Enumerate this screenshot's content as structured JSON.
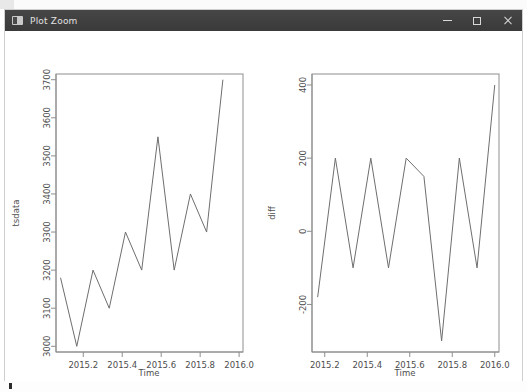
{
  "window": {
    "title": "Plot Zoom",
    "icon": "window-app-icon",
    "controls": {
      "minimize": "minimize-icon",
      "maximize": "maximize-icon",
      "close": "close-icon"
    }
  },
  "colors": {
    "titlebar_bg": "#3f3f3f",
    "titlebar_text": "#e2e2e2",
    "canvas_bg": "#ffffff",
    "axis": "#8e8e8e",
    "series_line": "#6e6e6e",
    "tick_text": "#4d4d4d",
    "desktop": "#fbfbfb"
  },
  "chart_data": [
    {
      "type": "line",
      "id": "tsdata-plot",
      "title": "",
      "xlabel": "Time",
      "ylabel": "tsdata",
      "x": [
        2015.0833,
        2015.1667,
        2015.25,
        2015.3333,
        2015.4167,
        2015.5,
        2015.5833,
        2015.6667,
        2015.75,
        2015.8333,
        2015.9167,
        2016.0
      ],
      "values": [
        3180,
        3000,
        3200,
        3100,
        3300,
        3200,
        3550,
        3200,
        3400,
        3300,
        3700
      ],
      "xtick_labels": [
        "2015.2",
        "2015.4",
        "2015.6",
        "2015.8",
        "2016.0"
      ],
      "xtick_values": [
        2015.2,
        2015.4,
        2015.6,
        2015.8,
        2016.0
      ],
      "ytick_labels": [
        "3000",
        "3100",
        "3200",
        "3300",
        "3400",
        "3500",
        "3600",
        "3700"
      ],
      "ytick_values": [
        3000,
        3100,
        3200,
        3300,
        3400,
        3500,
        3600,
        3700
      ],
      "xlim": [
        2015.06,
        2016.02
      ],
      "ylim": [
        2985,
        3715
      ],
      "grid": false,
      "legend": false
    },
    {
      "type": "line",
      "id": "diff-plot",
      "title": "",
      "xlabel": "Time",
      "ylabel": "diff",
      "x": [
        2015.1667,
        2015.25,
        2015.3333,
        2015.4167,
        2015.5,
        2015.5833,
        2015.6667,
        2015.75,
        2015.8333,
        2015.9167,
        2016.0
      ],
      "values": [
        -180,
        200,
        -100,
        200,
        -100,
        200,
        150,
        -300,
        200,
        -100,
        400
      ],
      "xtick_labels": [
        "2015.2",
        "2015.4",
        "2015.6",
        "2015.8",
        "2016.0"
      ],
      "xtick_values": [
        2015.2,
        2015.4,
        2015.6,
        2015.8,
        2016.0
      ],
      "ytick_labels": [
        "-200",
        "0",
        "200",
        "400"
      ],
      "ytick_values": [
        -200,
        0,
        200,
        400
      ],
      "xlim": [
        2015.14,
        2016.02
      ],
      "ylim": [
        -330,
        430
      ],
      "grid": false,
      "legend": false
    }
  ]
}
